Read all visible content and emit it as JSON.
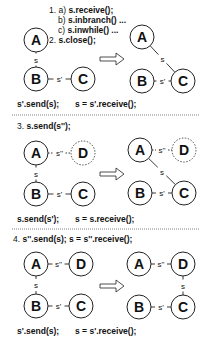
{
  "colors": {
    "stroke": "#222222",
    "text": "#111111",
    "divider": "#666666",
    "background": "#ffffff"
  },
  "node_radius": 12,
  "panels": [
    {
      "id": "panel-1",
      "title_lines": [
        {
          "x": 49,
          "y": 13,
          "prefix": "1. a) ",
          "code": "s.receive();"
        },
        {
          "x": 58,
          "y": 23,
          "prefix": "b) ",
          "code": "s.inbranch() ..."
        },
        {
          "x": 58,
          "y": 33,
          "prefix": "c) ",
          "code": "s.inwhile() ..."
        },
        {
          "x": 49,
          "y": 43,
          "prefix": "2. ",
          "code": "s.close();"
        }
      ],
      "arrow": {
        "x": 100,
        "y": 59
      },
      "before": {
        "nodes": [
          {
            "id": "A",
            "label": "A",
            "x": 36,
            "y": 40,
            "dashed": false
          },
          {
            "id": "B",
            "label": "B",
            "x": 36,
            "y": 79,
            "dashed": false
          },
          {
            "id": "C",
            "label": "C",
            "x": 83,
            "y": 79,
            "dashed": false
          }
        ],
        "edges": [
          {
            "from": "A",
            "to": "B",
            "label": "s",
            "dashed": false
          },
          {
            "from": "B",
            "to": "C",
            "label": "s'",
            "dashed": false
          }
        ]
      },
      "after": {
        "nodes": [
          {
            "id": "A",
            "label": "A",
            "x": 142,
            "y": 37,
            "dashed": false
          },
          {
            "id": "B",
            "label": "B",
            "x": 142,
            "y": 81,
            "dashed": false
          },
          {
            "id": "C",
            "label": "C",
            "x": 183,
            "y": 81,
            "dashed": false
          }
        ],
        "edges": [
          {
            "from": "A",
            "to": "C",
            "label": "s",
            "dashed": false
          },
          {
            "from": "B",
            "to": "C",
            "label": "s'",
            "dashed": false
          }
        ]
      },
      "footer": [
        {
          "x": 17,
          "y": 107,
          "text": "s'.send(s);"
        },
        {
          "x": 75,
          "y": 107,
          "text": "s = s'.receive();"
        }
      ],
      "divider_y": 115
    },
    {
      "id": "panel-2",
      "title_lines": [
        {
          "x": 17,
          "y": 129,
          "prefix": "3. ",
          "code": "s.send(s'');"
        }
      ],
      "arrow": {
        "x": 100,
        "y": 174
      },
      "before": {
        "nodes": [
          {
            "id": "A",
            "label": "A",
            "x": 36,
            "y": 153,
            "dashed": false
          },
          {
            "id": "D",
            "label": "D",
            "x": 83,
            "y": 153,
            "dashed": true
          },
          {
            "id": "B",
            "label": "B",
            "x": 36,
            "y": 194,
            "dashed": false
          },
          {
            "id": "C",
            "label": "C",
            "x": 83,
            "y": 194,
            "dashed": false
          }
        ],
        "edges": [
          {
            "from": "A",
            "to": "D",
            "label": "s''",
            "dashed": true
          },
          {
            "from": "A",
            "to": "B",
            "label": "s",
            "dashed": false
          },
          {
            "from": "B",
            "to": "C",
            "label": "s'",
            "dashed": false
          }
        ]
      },
      "after": {
        "nodes": [
          {
            "id": "A",
            "label": "A",
            "x": 140,
            "y": 150,
            "dashed": false
          },
          {
            "id": "D",
            "label": "D",
            "x": 184,
            "y": 150,
            "dashed": true
          },
          {
            "id": "B",
            "label": "B",
            "x": 140,
            "y": 193,
            "dashed": false
          },
          {
            "id": "C",
            "label": "C",
            "x": 184,
            "y": 193,
            "dashed": false
          }
        ],
        "edges": [
          {
            "from": "A",
            "to": "D",
            "label": "s''",
            "dashed": true
          },
          {
            "from": "A",
            "to": "C",
            "label": "s",
            "dashed": false
          },
          {
            "from": "B",
            "to": "C",
            "label": "s'",
            "dashed": false
          }
        ]
      },
      "footer": [
        {
          "x": 17,
          "y": 222,
          "text": "s.send(s');"
        },
        {
          "x": 75,
          "y": 222,
          "text": "s = s.receive();"
        }
      ],
      "divider_y": 229
    },
    {
      "id": "panel-3",
      "title_lines": [
        {
          "x": 13,
          "y": 242,
          "prefix": "4. ",
          "code": "s''.send(s);   s = s''.receive();"
        }
      ],
      "arrow": {
        "x": 100,
        "y": 286
      },
      "before": {
        "nodes": [
          {
            "id": "A",
            "label": "A",
            "x": 36,
            "y": 264,
            "dashed": false
          },
          {
            "id": "D",
            "label": "D",
            "x": 81,
            "y": 264,
            "dashed": false
          },
          {
            "id": "B",
            "label": "B",
            "x": 36,
            "y": 306,
            "dashed": false
          },
          {
            "id": "C",
            "label": "C",
            "x": 81,
            "y": 306,
            "dashed": false
          }
        ],
        "edges": [
          {
            "from": "A",
            "to": "D",
            "label": "s''",
            "dashed": false
          },
          {
            "from": "A",
            "to": "B",
            "label": "s",
            "dashed": false
          },
          {
            "from": "B",
            "to": "C",
            "label": "s'",
            "dashed": false
          }
        ]
      },
      "after": {
        "nodes": [
          {
            "id": "A",
            "label": "A",
            "x": 139,
            "y": 264,
            "dashed": false
          },
          {
            "id": "D",
            "label": "D",
            "x": 183,
            "y": 264,
            "dashed": false
          },
          {
            "id": "B",
            "label": "B",
            "x": 139,
            "y": 307,
            "dashed": false
          },
          {
            "id": "C",
            "label": "C",
            "x": 183,
            "y": 307,
            "dashed": false
          }
        ],
        "edges": [
          {
            "from": "A",
            "to": "D",
            "label": "s''",
            "dashed": false
          },
          {
            "from": "D",
            "to": "C",
            "label": "s",
            "dashed": false
          },
          {
            "from": "B",
            "to": "C",
            "label": "s'",
            "dashed": false
          }
        ]
      },
      "footer": [
        {
          "x": 17,
          "y": 334,
          "text": "s'.send(s);"
        },
        {
          "x": 75,
          "y": 334,
          "text": "s = s'.receive();"
        }
      ],
      "divider_y": null
    }
  ]
}
